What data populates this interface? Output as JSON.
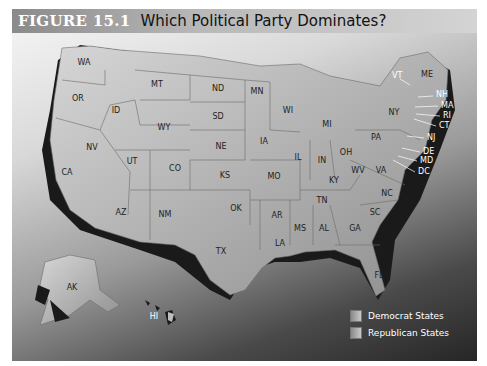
{
  "figure": {
    "number": "FIGURE 15.1",
    "title": "Which Political Party Dominates?"
  },
  "map": {
    "states": [
      {
        "abbr": "WA",
        "x": 72,
        "y": 62
      },
      {
        "abbr": "OR",
        "x": 78,
        "y": 98
      },
      {
        "abbr": "ID",
        "x": 116,
        "y": 110
      },
      {
        "abbr": "MT",
        "x": 157,
        "y": 84
      },
      {
        "abbr": "WY",
        "x": 164,
        "y": 127
      },
      {
        "abbr": "ND",
        "x": 218,
        "y": 88
      },
      {
        "abbr": "SD",
        "x": 218,
        "y": 116
      },
      {
        "abbr": "NE",
        "x": 221,
        "y": 146
      },
      {
        "abbr": "KS",
        "x": 225,
        "y": 175
      },
      {
        "abbr": "NV",
        "x": 92,
        "y": 147
      },
      {
        "abbr": "UT",
        "x": 132,
        "y": 161
      },
      {
        "abbr": "CO",
        "x": 175,
        "y": 168
      },
      {
        "abbr": "CA",
        "x": 67,
        "y": 172
      },
      {
        "abbr": "AZ",
        "x": 121,
        "y": 212
      },
      {
        "abbr": "NM",
        "x": 165,
        "y": 214
      },
      {
        "abbr": "OK",
        "x": 236,
        "y": 208
      },
      {
        "abbr": "TX",
        "x": 221,
        "y": 251
      },
      {
        "abbr": "MN",
        "x": 257,
        "y": 91
      },
      {
        "abbr": "WI",
        "x": 288,
        "y": 110
      },
      {
        "abbr": "IA",
        "x": 264,
        "y": 141
      },
      {
        "abbr": "IL",
        "x": 298,
        "y": 157
      },
      {
        "abbr": "MO",
        "x": 274,
        "y": 176
      },
      {
        "abbr": "AR",
        "x": 277,
        "y": 215
      },
      {
        "abbr": "LA",
        "x": 280,
        "y": 243
      },
      {
        "abbr": "MS",
        "x": 300,
        "y": 228
      },
      {
        "abbr": "AL",
        "x": 324,
        "y": 228
      },
      {
        "abbr": "TN",
        "x": 322,
        "y": 200
      },
      {
        "abbr": "KY",
        "x": 334,
        "y": 180
      },
      {
        "abbr": "IN",
        "x": 322,
        "y": 160
      },
      {
        "abbr": "OH",
        "x": 346,
        "y": 152
      },
      {
        "abbr": "MI",
        "x": 327,
        "y": 124
      },
      {
        "abbr": "WV",
        "x": 358,
        "y": 170
      },
      {
        "abbr": "VA",
        "x": 381,
        "y": 170
      },
      {
        "abbr": "NC",
        "x": 387,
        "y": 193
      },
      {
        "abbr": "SC",
        "x": 375,
        "y": 212
      },
      {
        "abbr": "GA",
        "x": 355,
        "y": 228
      },
      {
        "abbr": "FL",
        "x": 379,
        "y": 275
      },
      {
        "abbr": "PA",
        "x": 376,
        "y": 137
      },
      {
        "abbr": "NY",
        "x": 394,
        "y": 112
      },
      {
        "abbr": "ME",
        "x": 427,
        "y": 74
      },
      {
        "abbr": "AK",
        "x": 72,
        "y": 287
      },
      {
        "abbr": "HI",
        "x": 154,
        "y": 316
      }
    ],
    "callouts": [
      {
        "abbr": "VT",
        "x": 392,
        "y": 76
      },
      {
        "abbr": "NH",
        "x": 436,
        "y": 94
      },
      {
        "abbr": "MA",
        "x": 441,
        "y": 105
      },
      {
        "abbr": "RI",
        "x": 443,
        "y": 115
      },
      {
        "abbr": "CT",
        "x": 439,
        "y": 125
      },
      {
        "abbr": "NJ",
        "x": 427,
        "y": 137
      },
      {
        "abbr": "DE",
        "x": 423,
        "y": 151
      },
      {
        "abbr": "MD",
        "x": 420,
        "y": 160
      },
      {
        "abbr": "DC",
        "x": 418,
        "y": 171
      }
    ]
  },
  "legend": {
    "items": [
      {
        "label": "Democrat States"
      },
      {
        "label": "Republican States"
      }
    ]
  }
}
